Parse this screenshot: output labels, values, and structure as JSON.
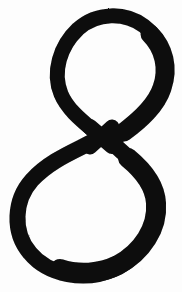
{
  "image": {
    "kind": "scanned-handwritten-glyph",
    "title": "Figure eight",
    "alt_text": "Hand-drawn black figure-eight glyph on white paper",
    "width": 182,
    "height": 292
  },
  "colors": {
    "background": "#fdfdfd",
    "ink": "#0a0a0a",
    "page": "#ffffff"
  },
  "glyph": {
    "name": "figure-eight",
    "character": "8",
    "description": "Calligraphic figure eight with a small pointed upper loop and a large rounded lower loop, crossing near the vertical center",
    "stroke": {
      "min_width_px": 13,
      "max_width_px": 20,
      "style": "brush-pen, variable width"
    },
    "crossing_point": {
      "x": 100,
      "y": 136
    },
    "bounds": {
      "left": 10,
      "top": 14,
      "right": 168,
      "bottom": 277
    },
    "upper_loop": {
      "name": "upper-loop",
      "shape": "teardrop",
      "tilt": "right-leaning",
      "top_y": 14,
      "left_x": 55,
      "right_x": 168,
      "bottom_y": 136,
      "counter_shape": "pointed teardrop, apex at bottom"
    },
    "lower_loop": {
      "name": "lower-loop",
      "shape": "rounded-oval",
      "tilt": "right-leaning",
      "top_y": 136,
      "left_x": 10,
      "right_x": 150,
      "bottom_y": 277,
      "counter_shape": "rounded oval"
    },
    "outline_path": "M 100 136 C 84 122 66 110 59 93 C 50 71 58 44 76 27 C 95 9 124 9 144 23 C 164 37 170 62 163 85 C 155 112 130 127 112 143 C 130 159 150 173 155 196 C 162 226 143 258 114 271 C 84 284 46 277 27 255 C 8 233 10 200 29 179 C 48 158 76 149 100 136 Z"
  },
  "strokes": [
    {
      "name": "upper-loop-stroke",
      "d": "M 101 137 C 85 123 68 111 61 94 C 52 72 60 46 78 29 C 97 12 125 12 144 26 C 163 40 169 64 162 86 C 154 112 129 127 111 142"
    },
    {
      "name": "lower-loop-stroke",
      "d": "M 111 142 C 129 158 149 174 154 196 C 161 225 142 256 114 269 C 85 282 48 275 30 253 C 12 232 14 200 32 180 C 51 159 78 150 101 137"
    }
  ]
}
